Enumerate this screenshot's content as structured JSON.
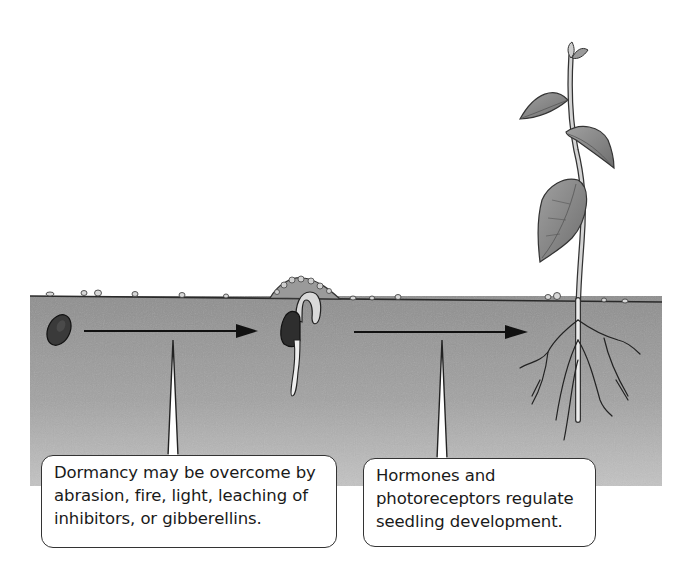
{
  "diagram": {
    "stages": [
      {
        "id": "dormant-seed",
        "label": "Dormant seed in soil"
      },
      {
        "id": "germinating-seed",
        "label": "Germinating seed with emerging radicle and hypocotyl hook"
      },
      {
        "id": "seedling",
        "label": "Established seedling with leaves and branched root system"
      }
    ],
    "arrows": [
      {
        "from": "dormant-seed",
        "to": "germinating-seed"
      },
      {
        "from": "germinating-seed",
        "to": "seedling"
      }
    ],
    "callouts": [
      {
        "id": "dormancy",
        "points_to_arrow": 0,
        "lines": [
          "Dormancy may be overcome by",
          "abrasion, fire, light, leaching of",
          "inhibitors, or gibberellins."
        ]
      },
      {
        "id": "hormones",
        "points_to_arrow": 1,
        "lines": [
          "Hormones and",
          "photoreceptors regulate",
          "seedling development."
        ]
      }
    ],
    "colors": {
      "background": "#ffffff",
      "soil": "#9e9e9e",
      "soil_light": "#b8b8b8",
      "outline": "#222222",
      "seed": "#3a3a3a",
      "leaf": "#8c8c8c",
      "root": "#e6e6e6",
      "callout_border": "#333333",
      "text": "#1a1a1a"
    }
  }
}
